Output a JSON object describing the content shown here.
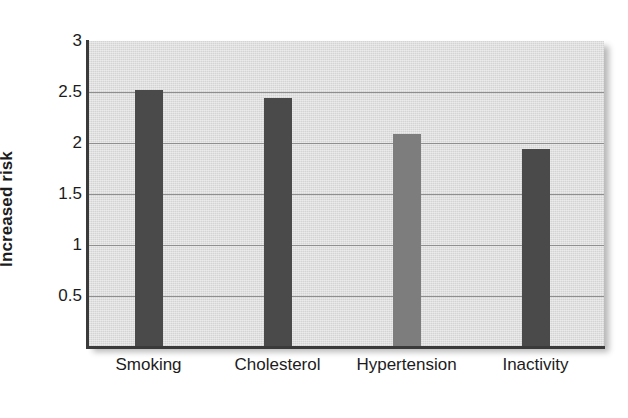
{
  "chart_data": {
    "type": "bar",
    "title": "",
    "subtitle": "",
    "xlabel": "",
    "ylabel": "Increased risk",
    "categories": [
      "Smoking",
      "Cholesterol",
      "Hypertension",
      "Inactivity"
    ],
    "values": [
      2.52,
      2.44,
      2.09,
      1.94
    ],
    "series": [
      {
        "name": "Increased risk",
        "values": [
          2.52,
          2.44,
          2.09,
          1.94
        ]
      }
    ],
    "bar_colors": [
      "#4a4a4a",
      "#4a4a4a",
      "#7d7d7d",
      "#4a4a4a"
    ],
    "ylim": [
      0,
      3
    ],
    "yticks": [
      0.5,
      1,
      1.5,
      2,
      2.5,
      3
    ],
    "ytick_labels": [
      "0.5",
      "1",
      "1.5",
      "2",
      "2.5",
      "3"
    ],
    "grid": true,
    "grid_axis": "y",
    "legend": false,
    "legend_position": "none",
    "plot_background": "#dcdcdc",
    "axis_color": "#3a3a3a",
    "gridline_color": "#8f8f8f"
  }
}
